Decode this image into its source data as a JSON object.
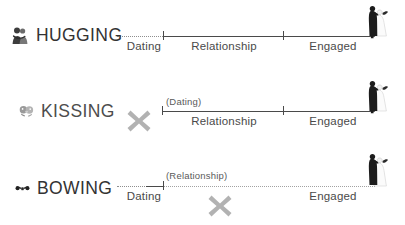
{
  "diagram": {
    "background_color": "#ffffff",
    "axis_color": "#4a4a4a",
    "muted_color": "#8e8e8e",
    "x_mark_color": "#b0b0b0",
    "text_color": "#4a4a4a"
  },
  "rows": [
    {
      "id": "hugging",
      "act_label": "HUGGING",
      "icon_name": "hugging-couple-icon",
      "stages": {
        "dating": "Dating",
        "relationship": "Relationship",
        "engaged": "Engaged"
      },
      "has_x_mark": false,
      "dotted_stage": "Dating",
      "parenthetical_label": "",
      "end_icon_name": "wedding-couple-icon"
    },
    {
      "id": "kissing",
      "act_label": "KISSING",
      "icon_name": "kissing-couple-icon",
      "stages": {
        "dating": "(Dating)",
        "relationship": "Relationship",
        "engaged": "Engaged"
      },
      "has_x_mark": true,
      "x_mark_name": "x-mark-dating-excluded",
      "dotted_stage": "",
      "parenthetical_label": "(Dating)",
      "end_icon_name": "wedding-couple-icon"
    },
    {
      "id": "bowing",
      "act_label": "BOWING",
      "icon_name": "bowing-couple-icon",
      "stages": {
        "dating": "Dating",
        "relationship": "(Relationship)",
        "engaged": "Engaged"
      },
      "has_x_mark": true,
      "x_mark_name": "x-mark-relationship-excluded",
      "dotted_stage": "Relationship",
      "parenthetical_label": "(Relationship)",
      "end_icon_name": "wedding-couple-icon"
    }
  ]
}
